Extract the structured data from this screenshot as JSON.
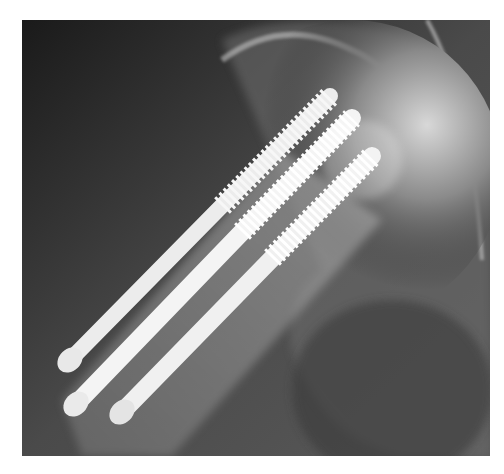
{
  "image": {
    "subject": "hip radiograph with three parallel cannulated screws",
    "screw_count": 3,
    "colors": {
      "background_dark": "#1e1e1e",
      "bone": "#9a9a9a",
      "screw": "#f2f2f2",
      "page": "#ffffff"
    }
  }
}
